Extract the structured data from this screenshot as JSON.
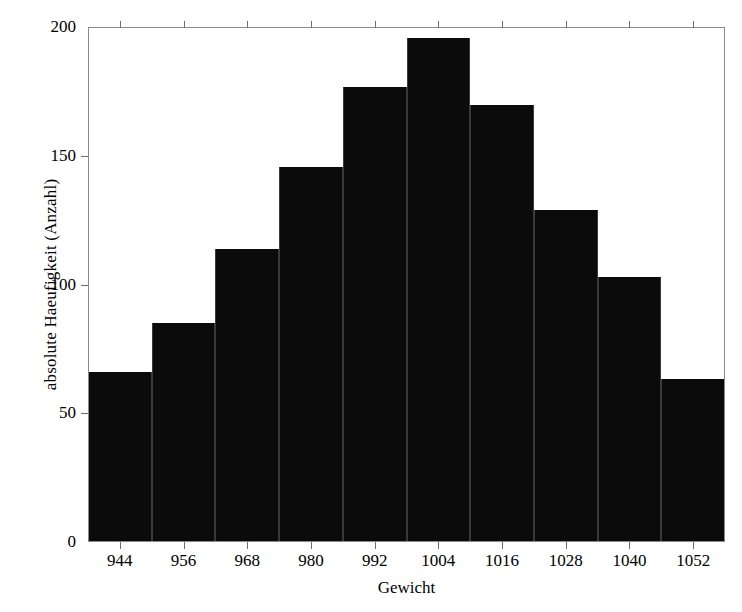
{
  "chart_data": {
    "type": "bar",
    "title": "",
    "xlabel": "Gewicht",
    "ylabel": "absolute Haeufigkeit (Anzahl)",
    "categories": [
      "944",
      "956",
      "968",
      "980",
      "992",
      "1004",
      "1016",
      "1028",
      "1040",
      "1052"
    ],
    "values": [
      66,
      85,
      114,
      146,
      177,
      196,
      170,
      129,
      103,
      63
    ],
    "bin_edges": [
      938,
      950,
      962,
      974,
      986,
      998,
      1010,
      1022,
      1034,
      1046,
      1058
    ],
    "bin_width": 12,
    "xlim": [
      938,
      1058
    ],
    "ylim": [
      0,
      200
    ],
    "yticks": [
      0,
      50,
      100,
      150,
      200
    ],
    "ytick_labels": [
      "0",
      "50",
      "100",
      "150",
      "200"
    ],
    "xticks": [
      944,
      956,
      968,
      980,
      992,
      1004,
      1016,
      1028,
      1040,
      1052
    ],
    "xtick_labels": [
      "944",
      "956",
      "968",
      "980",
      "992",
      "1004",
      "1016",
      "1028",
      "1040",
      "1052"
    ],
    "grid": false,
    "legend": false,
    "bar_color": "#0b0b0b",
    "frame_color": "#8a8a8a",
    "background_color": "#ffffff"
  }
}
